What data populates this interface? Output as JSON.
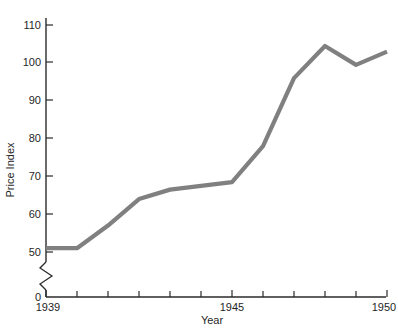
{
  "chart_data": {
    "type": "line",
    "title": "",
    "xlabel": "Year",
    "ylabel": "Price Index",
    "x": [
      1939,
      1940,
      1941,
      1942,
      1943,
      1944,
      1945,
      1946,
      1947,
      1948,
      1949,
      1950
    ],
    "values": [
      51,
      51,
      57,
      64,
      66.5,
      67.5,
      68.5,
      78,
      96,
      104.5,
      99.5,
      103
    ],
    "series": [
      {
        "name": "Price Index",
        "values": [
          51,
          51,
          57,
          64,
          66.5,
          67.5,
          68.5,
          78,
          96,
          104.5,
          99.5,
          103
        ]
      }
    ],
    "xlim": [
      1939,
      1950
    ],
    "ylim": [
      0,
      114
    ],
    "x_tick_labels": [
      "1939",
      "",
      "",
      "",
      "",
      "",
      "1945",
      "",
      "",
      "",
      "",
      "1950"
    ],
    "x_ticks": [
      1939,
      1940,
      1941,
      1942,
      1943,
      1944,
      1945,
      1946,
      1947,
      1948,
      1949,
      1950
    ],
    "y_ticks": [
      0,
      50,
      60,
      70,
      80,
      90,
      100,
      110
    ],
    "y_tick_labels": [
      "0",
      "50",
      "60",
      "70",
      "80",
      "90",
      "100",
      "110"
    ],
    "axis_break": true,
    "axis_break_between": [
      0,
      50
    ],
    "grid": false,
    "legend": "none",
    "line_color": "#808080",
    "axis_color": "#2b2b2b",
    "background_color": "#ffffff"
  },
  "axes": {
    "x_title": "Year",
    "y_title": "Price Index",
    "x_labels": [
      {
        "value": "1939",
        "year": 1939
      },
      {
        "value": "1945",
        "year": 1945
      },
      {
        "value": "1950",
        "year": 1950
      }
    ],
    "y_labels": [
      "110",
      "100",
      "90",
      "80",
      "70",
      "60",
      "50",
      "0"
    ]
  }
}
